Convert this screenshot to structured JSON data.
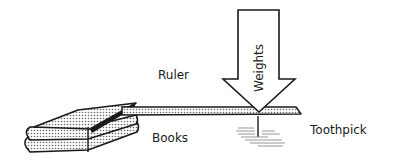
{
  "diagram": {
    "labels": {
      "ruler": "Ruler",
      "books": "Books",
      "weights": "Weights",
      "toothpick": "Toothpick"
    },
    "colors": {
      "ink": "#1a1a1a",
      "stipple": "#9a9a9a",
      "paper": "#ffffff"
    }
  }
}
